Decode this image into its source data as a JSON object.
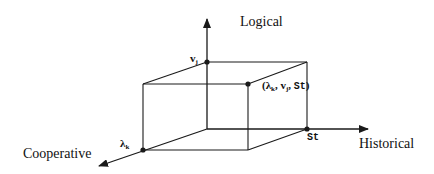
{
  "diagram": {
    "type": "3d-axes-cube",
    "axes": [
      {
        "name": "logical",
        "label": "Logical",
        "direction": "up"
      },
      {
        "name": "historical",
        "label": "Historical",
        "direction": "right"
      },
      {
        "name": "cooperative",
        "label": "Cooperative",
        "direction": "down-left"
      }
    ],
    "points": {
      "vj": {
        "symbol": "v",
        "sub": "j",
        "axis": "Logical"
      },
      "st": {
        "symbol": "St",
        "axis": "Historical"
      },
      "lk": {
        "symbol": "λ",
        "sub": "k",
        "axis": "Cooperative"
      },
      "corner": {
        "open": "(",
        "l_symbol": "λ",
        "l_sub": "k",
        "sep1": ", ",
        "v_symbol": "v",
        "v_sub": "j",
        "sep2": ", ",
        "s_symbol": "St",
        "close": ")"
      }
    },
    "colors": {
      "line": "#1a1a1a",
      "background": "#ffffff"
    }
  }
}
